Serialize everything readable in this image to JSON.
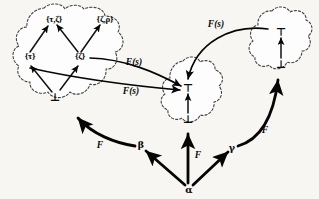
{
  "figure": {
    "caption": "",
    "background_color": "#f7f6f3",
    "ink_color": "#0a0a0a"
  },
  "clouds": [
    {
      "id": "left",
      "name": "left-powerset-lattice"
    },
    {
      "id": "middle",
      "name": "middle-two-point-lattice"
    },
    {
      "id": "right",
      "name": "right-two-point-lattice"
    }
  ],
  "nodes": {
    "left": [
      {
        "id": "tz",
        "label": "{τ,ζ}"
      },
      {
        "id": "zr",
        "label": "{ζ,ρ}"
      },
      {
        "id": "t",
        "label": "{τ}"
      },
      {
        "id": "z",
        "label": "{ζ}"
      },
      {
        "id": "bot",
        "label": "⊥"
      }
    ],
    "middle": [
      {
        "id": "top",
        "label": "⊤"
      },
      {
        "id": "bot",
        "label": "⊥"
      }
    ],
    "right": [
      {
        "id": "top",
        "label": "⊤"
      },
      {
        "id": "bot",
        "label": "⊥"
      }
    ],
    "base": [
      {
        "id": "alpha",
        "label": "α"
      },
      {
        "id": "beta",
        "label": "β"
      },
      {
        "id": "gamma",
        "label": "γ"
      }
    ]
  },
  "edge_labels": {
    "fs_top_right": "F(s)",
    "fs_upper_left": "F(s)",
    "fs_lower_left": "F(s)",
    "f_left": "F",
    "f_middle": "F",
    "f_right": "F"
  }
}
